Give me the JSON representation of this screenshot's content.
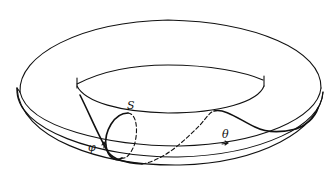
{
  "figure": {
    "type": "diagram",
    "colors": {
      "stroke": "#111111",
      "background": "#ffffff"
    }
  },
  "labels": {
    "surface_label": "S",
    "angle_theta": "θ",
    "angle_phi": "φ"
  },
  "curves": [
    {
      "name": "outer-rim",
      "style": "solid"
    },
    {
      "name": "rim-lower-edge",
      "style": "solid"
    },
    {
      "name": "inner-hole-top",
      "style": "solid"
    },
    {
      "name": "inner-hole-bottom",
      "style": "solid"
    },
    {
      "name": "meridian-loop-S",
      "style": "solid front / dashed back"
    },
    {
      "name": "knotted-curve",
      "style": "solid front / dashed back"
    },
    {
      "name": "theta-longitude",
      "style": "solid with arrow"
    }
  ]
}
